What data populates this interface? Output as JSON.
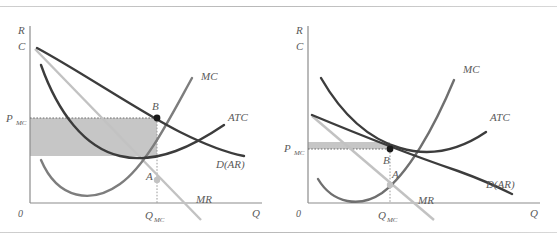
{
  "figure": {
    "title": "",
    "panels": [
      {
        "id": "left-panel",
        "name": "short-run-monopolistic-competition",
        "axes": {
          "y_label_top": "R",
          "y_label_bottom": "C",
          "x_label": "Q",
          "origin_label": "0"
        },
        "ticks": {
          "price": "P",
          "price_sub": "MC",
          "quantity": "Q",
          "quantity_sub": "MC"
        },
        "curves": [
          {
            "name": "marginal-cost",
            "label": "MC",
            "color": "#7d7d7d"
          },
          {
            "name": "average-total-cost",
            "label": "ATC",
            "color": "#3c3c3c"
          },
          {
            "name": "demand-average-revenue",
            "label": "D(AR)",
            "color": "#3c3c3c"
          },
          {
            "name": "marginal-revenue",
            "label": "MR",
            "color": "#c2c2c2"
          }
        ],
        "points": [
          {
            "name": "point-b",
            "label": "B",
            "desc": "price on demand curve at Q_MC"
          },
          {
            "name": "point-a",
            "label": "A",
            "desc": "MR equals MC intersection"
          }
        ],
        "shaded_region": {
          "name": "economic-profit-area",
          "color": "#c6c6c6",
          "desc": "profit rectangle from 0 to Q_MC between ATC and P_MC"
        }
      },
      {
        "id": "right-panel",
        "name": "long-run-monopolistic-competition",
        "axes": {
          "y_label_top": "R",
          "y_label_bottom": "C",
          "x_label": "Q",
          "origin_label": "0"
        },
        "ticks": {
          "price": "P",
          "price_sub": "MC",
          "quantity": "Q",
          "quantity_sub": "MC"
        },
        "curves": [
          {
            "name": "marginal-cost",
            "label": "MC",
            "color": "#6f6f6f"
          },
          {
            "name": "average-total-cost",
            "label": "ATC",
            "color": "#3c3c3c"
          },
          {
            "name": "demand-average-revenue",
            "label": "D(AR)",
            "color": "#3c3c3c"
          },
          {
            "name": "marginal-revenue",
            "label": "MR",
            "color": "#c2c2c2"
          }
        ],
        "points": [
          {
            "name": "point-b",
            "label": "B",
            "desc": "tangency of demand and ATC"
          },
          {
            "name": "point-a",
            "label": "A",
            "desc": "MR equals MC intersection"
          }
        ],
        "shaded_region": {
          "name": "zero-profit-band",
          "color": "#c6c6c6",
          "desc": "thin band at P_MC showing zero economic profit"
        }
      }
    ],
    "colors": {
      "axis": "#8c8c8c",
      "dark_curve": "#3c3c3c",
      "mid_curve": "#7d7d7d",
      "light_curve": "#c2c2c2",
      "shade": "#c6c6c6",
      "rule": "#c4c4c4",
      "text": "#5a5a5a",
      "point": "#1a1a1a"
    }
  }
}
